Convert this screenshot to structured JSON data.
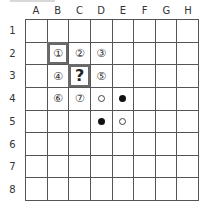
{
  "columns": [
    "A",
    "B",
    "C",
    "D",
    "E",
    "F",
    "G",
    "H"
  ],
  "rows": [
    "1",
    "2",
    "3",
    "4",
    "5",
    "6",
    "7",
    "8"
  ],
  "colors": {
    "grid": "#555555",
    "highlight_border": "#6a6a6a",
    "black_stone": "#111111",
    "white_stone": "#ffffff"
  },
  "cells": [
    {
      "pos": "B2",
      "row": 2,
      "col": 2,
      "type": "number",
      "text": "①",
      "highlighted": true
    },
    {
      "pos": "C2",
      "row": 2,
      "col": 3,
      "type": "number",
      "text": "②",
      "highlighted": false
    },
    {
      "pos": "D2",
      "row": 2,
      "col": 4,
      "type": "number",
      "text": "③",
      "highlighted": false
    },
    {
      "pos": "B3",
      "row": 3,
      "col": 2,
      "type": "number",
      "text": "④",
      "highlighted": false
    },
    {
      "pos": "C3",
      "row": 3,
      "col": 3,
      "type": "question",
      "text": "?",
      "highlighted": true
    },
    {
      "pos": "D3",
      "row": 3,
      "col": 4,
      "type": "number",
      "text": "⑤",
      "highlighted": false
    },
    {
      "pos": "B4",
      "row": 4,
      "col": 2,
      "type": "number",
      "text": "⑥",
      "highlighted": false
    },
    {
      "pos": "C4",
      "row": 4,
      "col": 3,
      "type": "number",
      "text": "⑦",
      "highlighted": false
    },
    {
      "pos": "D4",
      "row": 4,
      "col": 4,
      "type": "stone",
      "stone": "white"
    },
    {
      "pos": "E4",
      "row": 4,
      "col": 5,
      "type": "stone",
      "stone": "black"
    },
    {
      "pos": "D5",
      "row": 5,
      "col": 4,
      "type": "stone",
      "stone": "black"
    },
    {
      "pos": "E5",
      "row": 5,
      "col": 5,
      "type": "stone",
      "stone": "white"
    }
  ]
}
